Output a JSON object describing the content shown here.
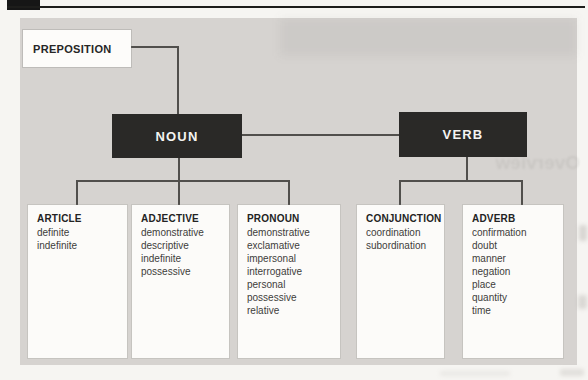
{
  "diagram": {
    "nodes": {
      "preposition": "PREPOSITION",
      "noun": "NOUN",
      "verb": "VERB"
    },
    "categories": [
      {
        "title": "ARTICLE",
        "items": [
          "definite",
          "indefinite"
        ]
      },
      {
        "title": "ADJECTIVE",
        "items": [
          "demonstrative",
          "descriptive",
          "indefinite",
          "possessive"
        ]
      },
      {
        "title": "PRONOUN",
        "items": [
          "demonstrative",
          "exclamative",
          "impersonal",
          "interrogative",
          "personal",
          "possessive",
          "relative"
        ]
      },
      {
        "title": "CONJUNCTION",
        "items": [
          "coordination",
          "subordination"
        ]
      },
      {
        "title": "ADVERB",
        "items": [
          "confirmation",
          "doubt",
          "manner",
          "negation",
          "place",
          "quantity",
          "time"
        ]
      }
    ],
    "colors": {
      "panel_background": "#d6d3d0",
      "node_dark": "#2a2927",
      "node_light": "#fdfcfa",
      "connector_line": "#514f4c",
      "header_bar": "#161616"
    }
  },
  "artifacts": {
    "bleedthrough_text": "Overview"
  }
}
